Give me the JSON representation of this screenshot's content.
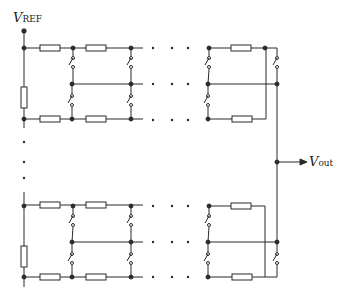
{
  "diagram": {
    "type": "resistor-string DAC with switch matrix",
    "labels": {
      "vref_main": "V",
      "vref_sub": "REF",
      "vout_main": "V",
      "vout_sub": "out"
    },
    "colors": {
      "line": "#2a2a2a",
      "resistor_fill": "#ffffff",
      "background": "#ffffff"
    },
    "blocks": [
      {
        "name": "upper-block",
        "rails_y": [
          48,
          84,
          119
        ]
      },
      {
        "name": "lower-block",
        "rails_y": [
          205,
          242,
          277
        ]
      }
    ],
    "columns_x": [
      24,
      72,
      131,
      208,
      266,
      277
    ],
    "vout_junction": {
      "x": 277,
      "y": 162
    }
  }
}
